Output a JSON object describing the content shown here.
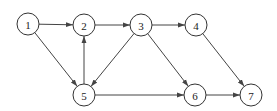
{
  "diagram": {
    "type": "directed-graph",
    "nodes": [
      {
        "id": "1",
        "label": "1"
      },
      {
        "id": "2",
        "label": "2"
      },
      {
        "id": "3",
        "label": "3"
      },
      {
        "id": "4",
        "label": "4"
      },
      {
        "id": "5",
        "label": "5"
      },
      {
        "id": "6",
        "label": "6"
      },
      {
        "id": "7",
        "label": "7"
      }
    ],
    "edges": [
      {
        "from": "1",
        "to": "2"
      },
      {
        "from": "1",
        "to": "5"
      },
      {
        "from": "2",
        "to": "3"
      },
      {
        "from": "3",
        "to": "4"
      },
      {
        "from": "3",
        "to": "5"
      },
      {
        "from": "3",
        "to": "6"
      },
      {
        "from": "5",
        "to": "2"
      },
      {
        "from": "5",
        "to": "6"
      },
      {
        "from": "4",
        "to": "7"
      },
      {
        "from": "6",
        "to": "7"
      }
    ],
    "colors": {
      "stroke": "#333333",
      "edge": "#444444",
      "background": "#ffffff"
    }
  }
}
